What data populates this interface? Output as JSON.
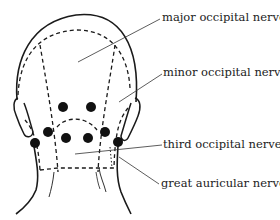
{
  "figure": {
    "labels": [
      {
        "id": "major",
        "text": "major occipital nerve",
        "x": 162,
        "y": 12
      },
      {
        "id": "minor",
        "text": "minor occipital nerve",
        "x": 163,
        "y": 67
      },
      {
        "id": "third",
        "text": "third occipital nerve",
        "x": 163,
        "y": 140
      },
      {
        "id": "great",
        "text": "great auricular nerve",
        "x": 161,
        "y": 178
      }
    ],
    "injection_points_count": 8,
    "colors": {
      "ink": "#1a1a1a",
      "background": "#ffffff"
    }
  }
}
